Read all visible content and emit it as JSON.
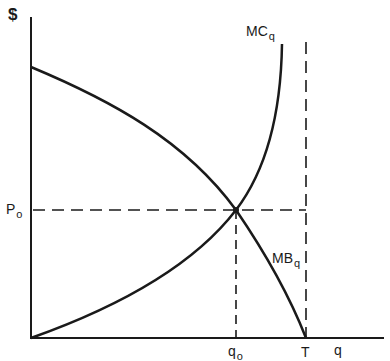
{
  "diagram": {
    "type": "economics-supply-demand",
    "y_axis_label": "$",
    "x_axis_label": "q",
    "price_label": {
      "main": "P",
      "sub": "o"
    },
    "quantity_label": {
      "main": "q",
      "sub": "o"
    },
    "threshold_label": "T",
    "curves": [
      {
        "id": "MC",
        "label_main": "MC",
        "label_sub": "q",
        "description": "Marginal cost, upward sloping convex, rising steeply near T"
      },
      {
        "id": "MB",
        "label_main": "MB",
        "label_sub": "q",
        "description": "Marginal benefit, downward sloping concave, reaching zero at T"
      }
    ],
    "equilibrium": {
      "price": "P_o",
      "quantity": "q_o"
    },
    "colors": {
      "line": "#1a1a1a",
      "background": "#ffffff"
    }
  }
}
